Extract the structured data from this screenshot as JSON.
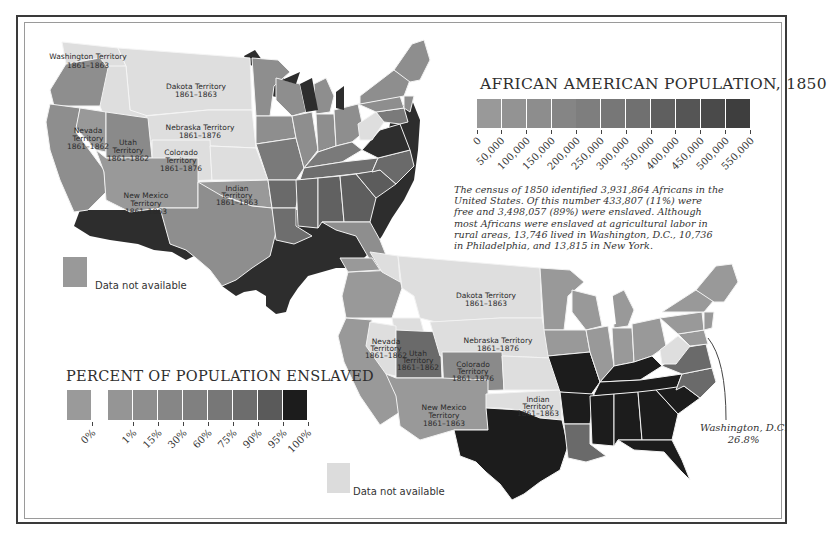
{
  "frame": {
    "outer_color": "#3a3a3a",
    "inner_color": "#9a9a9a"
  },
  "population_map": {
    "legend": {
      "title": "AFRICAN AMERICAN POPULATION, 1850",
      "ticks": [
        "0",
        "50,000",
        "100,000",
        "150,000",
        "200,000",
        "250,000",
        "300,000",
        "350,000",
        "400,000",
        "450,000",
        "500,000",
        "550,000"
      ],
      "swatch_colors": [
        "#999999",
        "#939393",
        "#8d8d8d",
        "#858585",
        "#7e7e7e",
        "#777777",
        "#707070",
        "#5f5f5f",
        "#555555",
        "#4a4a4a",
        "#3e3e3e"
      ]
    },
    "territories": [
      {
        "name": "Washington Territory",
        "years": "1861–1863"
      },
      {
        "name": "Dakota Territory",
        "years": "1861–1863"
      },
      {
        "name": "Nebraska Territory",
        "years": "1861–1876"
      },
      {
        "name": "Nevada Territory",
        "years": "1861–1862"
      },
      {
        "name": "Utah Territory",
        "years": "1861–1862"
      },
      {
        "name": "Colorado Territory",
        "years": "1861–1876"
      },
      {
        "name": "New Mexico Territory",
        "years": "1861–1863"
      },
      {
        "name": "Indian Territory",
        "years": "1861–1863"
      }
    ],
    "no_data": {
      "label": "Data not available",
      "color": "#999999"
    }
  },
  "census_note": "The census of 1850 identified 3,931,864 Africans in the United States. Of this number 433,807 (11%) were free and 3,498,057 (89%) were enslaved. Although most Africans were enslaved at agricultural labor in rural areas, 13,746 lived in Washington, D.C., 10,736 in Philadelphia, and 13,815 in New York.",
  "enslaved_map": {
    "legend": {
      "title": "PERCENT OF POPULATION ENSLAVED",
      "ticks": [
        "0%",
        "1%",
        "15%",
        "30%",
        "60%",
        "75%",
        "90%",
        "95%",
        "100%"
      ],
      "swatch_colors": [
        "#9a9a9a",
        "#959595",
        "#8e8e8e",
        "#868686",
        "#808080",
        "#777777",
        "#6d6d6d",
        "#5a5a5a",
        "#1c1c1c"
      ]
    },
    "territories": [
      {
        "name": "Dakota Territory",
        "years": "1861–1863"
      },
      {
        "name": "Nebraska Territory",
        "years": "1861–1876"
      },
      {
        "name": "Nevada Territory",
        "years": "1861–1862"
      },
      {
        "name": "Utah Territory",
        "years": "1861–1862"
      },
      {
        "name": "Colorado Territory",
        "years": "1861–1876"
      },
      {
        "name": "New Mexico Territory",
        "years": "1861–1863"
      },
      {
        "name": "Indian Territory",
        "years": "1861–1863"
      }
    ],
    "annotation": {
      "place": "Washington, D.C.",
      "value": "26.8%"
    },
    "no_data": {
      "label": "Data not available",
      "color": "#dcdcdc"
    }
  }
}
